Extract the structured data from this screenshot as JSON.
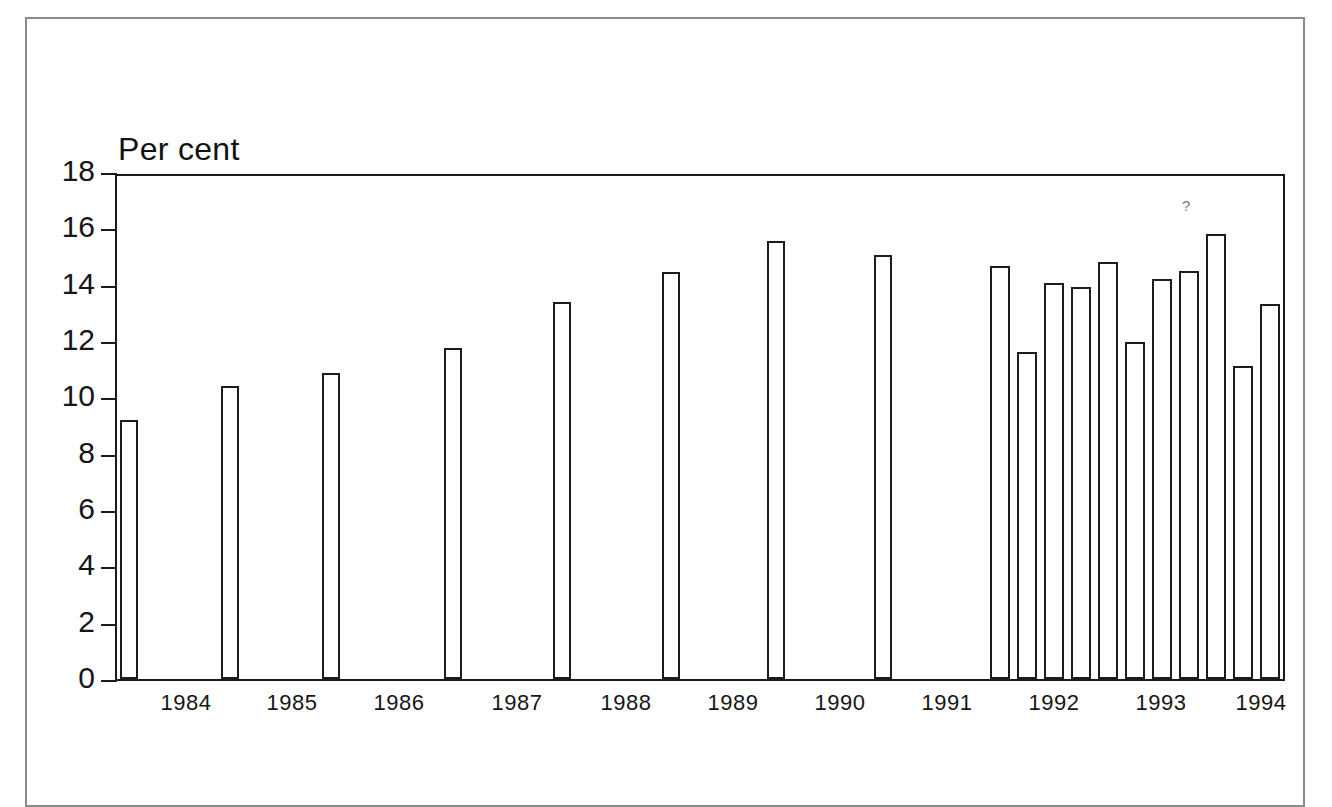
{
  "figure": {
    "unit_caption": "Per cent",
    "frame_color": "#8a8a8a",
    "axis_color": "#1a1a1a",
    "bar_outline_color": "#1c1c1c",
    "bar_fill_color": "#ffffff",
    "artifact_mark": "?"
  },
  "chart_data": {
    "type": "bar",
    "title": "",
    "subtitle": "",
    "xlabel": "",
    "ylabel": "Per cent",
    "ylim": [
      0,
      18
    ],
    "yticks": [
      0,
      2,
      4,
      6,
      8,
      10,
      12,
      14,
      16,
      18
    ],
    "ytick_labels": [
      "0",
      "2",
      "4",
      "6",
      "8",
      "10",
      "12",
      "14",
      "16",
      "18"
    ],
    "grid": false,
    "legend": null,
    "xtick_labels": [
      "1984",
      "1985",
      "1986",
      "1987",
      "1988",
      "1989",
      "1990",
      "1991",
      "1992",
      "1993",
      "1994"
    ],
    "categories": [
      "1983Q4",
      "1984Q4",
      "1985Q4",
      "1986Q4",
      "1987Q4",
      "1988Q4",
      "1989Q4",
      "1990Q4",
      "1991Q4",
      "1992Q1",
      "1992Q2",
      "1992Q3",
      "1992Q4",
      "1993Q1",
      "1993Q2",
      "1993Q3",
      "1993Q4",
      "1994Q1",
      "1994Q2"
    ],
    "values": [
      9.2,
      10.4,
      10.85,
      11.75,
      13.4,
      14.45,
      15.55,
      15.05,
      14.65,
      11.6,
      14.05,
      13.9,
      14.8,
      11.95,
      14.2,
      14.5,
      15.8,
      11.1,
      13.3
    ]
  },
  "bars": [
    {
      "label": "1983Q4",
      "value": 9.2,
      "x": 118,
      "width": 18
    },
    {
      "label": "1984Q4",
      "value": 10.4,
      "x": 219,
      "width": 18
    },
    {
      "label": "1985Q4",
      "value": 10.85,
      "x": 320,
      "width": 18
    },
    {
      "label": "1986Q4",
      "value": 11.75,
      "x": 442,
      "width": 18
    },
    {
      "label": "1987Q4",
      "value": 13.4,
      "x": 551,
      "width": 18
    },
    {
      "label": "1988Q4",
      "value": 14.45,
      "x": 660,
      "width": 18
    },
    {
      "label": "1989Q4",
      "value": 15.55,
      "x": 765,
      "width": 18
    },
    {
      "label": "1990Q4",
      "value": 15.05,
      "x": 872,
      "width": 18
    },
    {
      "label": "1991Q4",
      "value": 14.65,
      "x": 988,
      "width": 20
    },
    {
      "label": "1992Q1",
      "value": 11.6,
      "x": 1015,
      "width": 20
    },
    {
      "label": "1992Q2",
      "value": 14.05,
      "x": 1042,
      "width": 20
    },
    {
      "label": "1992Q3",
      "value": 13.9,
      "x": 1069,
      "width": 20
    },
    {
      "label": "1992Q4",
      "value": 14.8,
      "x": 1096,
      "width": 20
    },
    {
      "label": "1993Q1",
      "value": 11.95,
      "x": 1123,
      "width": 20
    },
    {
      "label": "1993Q2",
      "value": 14.2,
      "x": 1150,
      "width": 20
    },
    {
      "label": "1993Q3",
      "value": 14.5,
      "x": 1177,
      "width": 20
    },
    {
      "label": "1993Q4",
      "value": 15.8,
      "x": 1204,
      "width": 20
    },
    {
      "label": "1994Q1",
      "value": 11.1,
      "x": 1231,
      "width": 20
    },
    {
      "label": "1994Q2",
      "value": 13.3,
      "x": 1258,
      "width": 20
    }
  ],
  "xaxis_labels": [
    {
      "text": "1984",
      "x": 186
    },
    {
      "text": "1985",
      "x": 292
    },
    {
      "text": "1986",
      "x": 399
    },
    {
      "text": "1987",
      "x": 517
    },
    {
      "text": "1988",
      "x": 626
    },
    {
      "text": "1989",
      "x": 733
    },
    {
      "text": "1990",
      "x": 840
    },
    {
      "text": "1991",
      "x": 947
    },
    {
      "text": "1992",
      "x": 1054
    },
    {
      "text": "1993",
      "x": 1161
    },
    {
      "text": "1994",
      "x": 1261
    }
  ]
}
